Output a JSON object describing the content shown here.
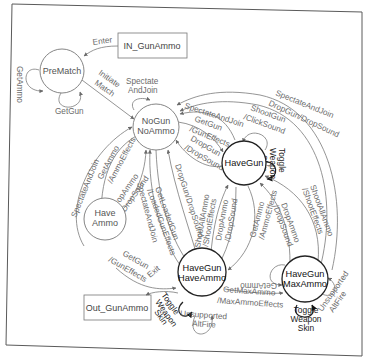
{
  "diagram": {
    "type": "state-machine",
    "frame": {
      "border_color": "#555555",
      "background": "#ffffff"
    },
    "entry_box": {
      "label": "IN_GunAmmo"
    },
    "exit_box": {
      "label": "Out_GunAmmo"
    },
    "states": {
      "prematch": {
        "label": "PreMatch"
      },
      "nogun_noammo": {
        "line1": "NoGun",
        "line2": "NoAmmo"
      },
      "havegun": {
        "label": "HaveGun"
      },
      "haveammo": {
        "line1": "Have",
        "line2": "Ammo"
      },
      "havegun_haveammo": {
        "line1": "HaveGun",
        "line2": "HaveAmmo"
      },
      "havegun_maxammo": {
        "line1": "HaveGun",
        "line2": "MaxAmmo"
      }
    },
    "transitions": {
      "enter": "Enter",
      "prematch_getammo": "GetAmmo",
      "prematch_getgun": "GetGun",
      "initiate_match_1": "Initiate",
      "initiate_match_2": "Match",
      "spectate_top_1": "Spectate",
      "spectate_top_2": "AndJoin",
      "outer_spectate": "SpectateAndJoin",
      "outer_dropgun": "DropGun/DropSound",
      "havegun_spectate": "SpectateAndJoin",
      "nogun_getgun_1": "GetGun",
      "nogun_getgun_2": "/GunEffects",
      "havegun_dropgun_1": "DropGun",
      "havegun_dropgun_2": "/DropSound",
      "shootgun_1": "ShootGun",
      "shootgun_2": "/ClickSound",
      "toggle_havegun_1": "Toggle",
      "toggle_havegun_2": "Weapon",
      "toggle_havegun_3": "Skin",
      "haveammo_spectate": "SpectateAndJoin",
      "getammo_1": "GetAmmo",
      "getammo_2": "/AmmoEffects",
      "dropammo_1": "DropAmmo",
      "dropammo_2": "/DropSound",
      "hh_spectate": "SpectateAndJoin",
      "getloaded_1": "GetLoadedGun",
      "getloaded_2": "/LoadedGunEffects",
      "hh_dropgun": "DropGun/DropSound",
      "hh_shootall_1": "ShootAllAmmo",
      "hh_shootall_2": "/ShootEffects",
      "hh_dropammo_1": "DropAmmo",
      "hh_dropammo_2": "/DropSound",
      "hg_getammo_1": "GetAmmo",
      "hg_getammo_2": "/AmmoEffects",
      "max_dropammo_1": "DropAmmo",
      "max_dropammo_2": "/DropSound",
      "max_shootall_1": "ShootAllAmmo",
      "max_shootall_2": "/ShootEffects",
      "haveammo_getgun_1": "GetGun",
      "haveammo_getgun_2": "/GunEffects",
      "exit": "Exit",
      "toggle_hh_1": "Toggle",
      "toggle_hh_2": "Weapon",
      "toggle_hh_3": "Skin",
      "unsupported_hh_1": "Unsupported",
      "unsupported_hh_2": "AltFire",
      "getmaxammo_1": "GetMaxAmmo",
      "getmaxammo_2": "/MaxAmmoEffects",
      "max_getammo": "GetAmmo",
      "toggle_max_1": "Toggle",
      "toggle_max_2": "Weapon",
      "toggle_max_3": "Skin",
      "unsupported_max_1": "Unsupported",
      "unsupported_max_2": "AltFire"
    }
  }
}
